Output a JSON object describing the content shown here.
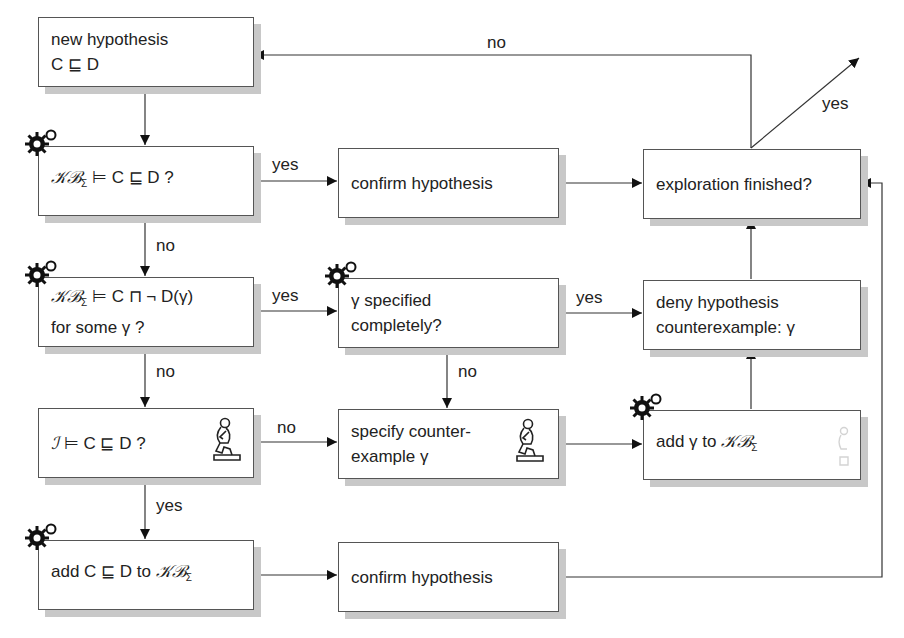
{
  "boxes": {
    "new_hypothesis": {
      "line1": "new hypothesis",
      "line2": "C ⊑ D"
    },
    "kb_entails": {
      "kb": "𝒦ℬ",
      "sub": "Σ",
      "rest": " ⊨ C ⊑ D ?"
    },
    "kb_counter": {
      "kb": "𝒦ℬ",
      "sub": "Σ",
      "rest": " ⊨ C ⊓ ¬ D(γ)",
      "line2": "for some γ ?"
    },
    "interp_entails": {
      "i": "ℐ",
      "rest": " ⊨ C ⊑ D ?"
    },
    "add_to_kb": {
      "pre": "add C ⊑ D to ",
      "kb": "𝒦ℬ",
      "sub": "Σ"
    },
    "confirm_top": {
      "text": "confirm hypothesis"
    },
    "gamma_specified": {
      "line1": "γ specified",
      "line2": "completely?"
    },
    "specify_counter": {
      "line1": "specify counter-",
      "line2": "example γ"
    },
    "confirm_bottom": {
      "text": "confirm hypothesis"
    },
    "exploration_finished": {
      "text": "exploration finished?"
    },
    "deny_hypothesis": {
      "line1": "deny hypothesis",
      "line2": "counterexample: γ"
    },
    "add_gamma": {
      "pre": "add γ to ",
      "kb": "𝒦ℬ",
      "sub": "Σ"
    }
  },
  "edge_labels": {
    "b_to_f": "yes",
    "b_to_c": "no",
    "c_to_g": "yes",
    "c_to_d": "no",
    "d_to_h": "no",
    "d_to_e": "yes",
    "g_to_k": "yes",
    "g_to_h": "no",
    "j_to_a": "no",
    "j_exit": "yes"
  },
  "icons": {
    "automated": "gear-icon",
    "human": "thinker-icon"
  },
  "colors": {
    "line": "#333333",
    "border": "#555555",
    "shadow": "#c8c8c8"
  }
}
